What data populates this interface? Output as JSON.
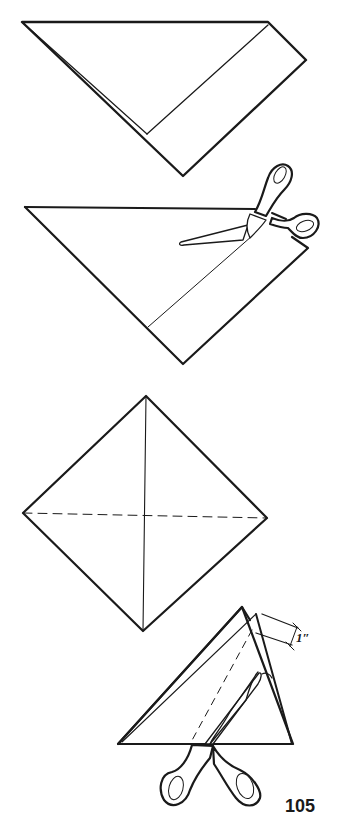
{
  "page": {
    "number": "105",
    "figures": [
      {
        "id": "fold-step-1",
        "description": "Square folded into a triangle with a strip folded over along one edge"
      },
      {
        "id": "cut-step-2",
        "description": "Scissors cutting off the excess strip along the fold line"
      },
      {
        "id": "square-step-3",
        "description": "Unfolded square with solid vertical crease and dashed horizontal fold line"
      },
      {
        "id": "notch-step-4",
        "description": "Folded triangle with scissors cutting along dashed line, 1 inch margin marked"
      }
    ],
    "dimension_label": "1″",
    "colors": {
      "ink": "#1a1a1a",
      "paper": "#ffffff"
    }
  }
}
